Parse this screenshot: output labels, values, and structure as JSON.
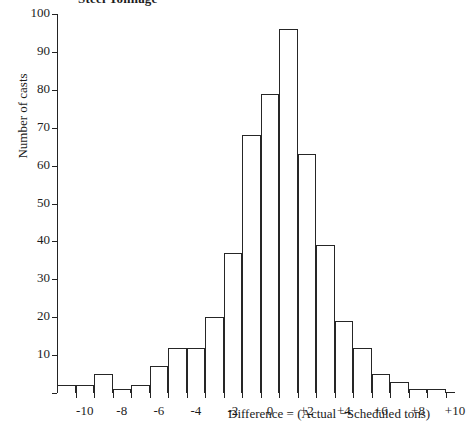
{
  "chart_data": {
    "type": "bar",
    "title": "Steel Tonnage",
    "xlabel": "Difference = (Actual −Scheduled tons)",
    "ylabel": "Number of casts",
    "xlim": [
      -11,
      10.5
    ],
    "ylim": [
      0,
      100
    ],
    "grid": false,
    "legend": "none",
    "bin_width": 1,
    "categories": [
      "-11",
      "-10",
      "-9",
      "-8",
      "-7",
      "-6",
      "-5",
      "-4",
      "-3",
      "-2",
      "-1",
      "0",
      "+1",
      "+2",
      "+3",
      "+4",
      "+5",
      "+6",
      "+7",
      "+8",
      "+9"
    ],
    "bin_starts": [
      -11,
      -10,
      -9,
      -8,
      -7,
      -6,
      -5,
      -4,
      -3,
      -2,
      -1,
      0,
      1,
      2,
      3,
      4,
      5,
      6,
      7,
      8,
      9
    ],
    "values": [
      2,
      2,
      5,
      1,
      2,
      7,
      12,
      12,
      20,
      37,
      68,
      79,
      96,
      63,
      39,
      19,
      12,
      5,
      3,
      1,
      1
    ],
    "ytick_values": [
      0,
      10,
      20,
      30,
      40,
      50,
      60,
      70,
      80,
      90,
      100
    ],
    "ytick_labels": [
      "",
      "10",
      "20",
      "30",
      "40",
      "50",
      "60",
      "70",
      "80",
      "90",
      "100"
    ],
    "xtick_values": [
      -10,
      -9,
      -8,
      -7,
      -6,
      -5,
      -4,
      -3,
      -2,
      -1,
      0,
      1,
      2,
      3,
      4,
      5,
      6,
      7,
      8,
      9,
      10
    ],
    "xtick_labeled": [
      -10,
      -8,
      -6,
      -4,
      -2,
      0,
      2,
      4,
      6,
      8,
      10
    ],
    "xtick_labels": [
      "-10",
      "-8",
      "-6",
      "-4",
      "-2",
      "0",
      "+2",
      "+4",
      "+6",
      "+8",
      "+10"
    ],
    "colors": {
      "bar_fill": "#ffffff",
      "bar_stroke": "#262626",
      "axis": "#232323",
      "text": "#1c1c1c",
      "background": "#ffffff"
    }
  }
}
